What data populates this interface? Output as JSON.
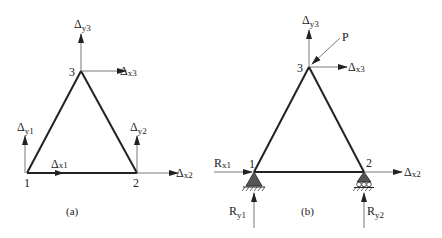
{
  "figure": {
    "panel_a": {
      "caption": "(a)",
      "nodes": [
        {
          "id": "1",
          "label": "1"
        },
        {
          "id": "2",
          "label": "2"
        },
        {
          "id": "3",
          "label": "3"
        }
      ],
      "dofs": [
        {
          "base": "Δ",
          "sub": "x1"
        },
        {
          "base": "Δ",
          "sub": "y1"
        },
        {
          "base": "Δ",
          "sub": "x2"
        },
        {
          "base": "Δ",
          "sub": "y2"
        },
        {
          "base": "Δ",
          "sub": "x3"
        },
        {
          "base": "Δ",
          "sub": "y3"
        }
      ]
    },
    "panel_b": {
      "caption": "(b)",
      "nodes": [
        {
          "id": "1",
          "label": "1"
        },
        {
          "id": "2",
          "label": "2"
        },
        {
          "id": "3",
          "label": "3"
        }
      ],
      "load": {
        "label": "P"
      },
      "dofs": [
        {
          "base": "Δ",
          "sub": "x2"
        },
        {
          "base": "Δ",
          "sub": "x3"
        },
        {
          "base": "Δ",
          "sub": "y3"
        }
      ],
      "reactions": [
        {
          "base": "R",
          "sub": "x1"
        },
        {
          "base": "R",
          "sub": "y1"
        },
        {
          "base": "R",
          "sub": "y2"
        }
      ],
      "supports": [
        {
          "node": "1",
          "type": "pin"
        },
        {
          "node": "2",
          "type": "roller"
        }
      ]
    }
  }
}
